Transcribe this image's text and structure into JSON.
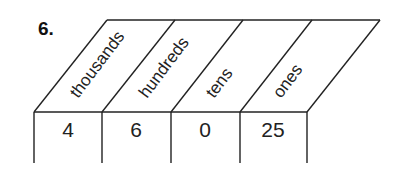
{
  "problem": {
    "number": "6."
  },
  "place_value_chart": {
    "columns": [
      {
        "header": "thousands",
        "value": "4"
      },
      {
        "header": "hundreds",
        "value": "6"
      },
      {
        "header": "tens",
        "value": "0"
      },
      {
        "header": "ones",
        "value": "25"
      }
    ]
  }
}
